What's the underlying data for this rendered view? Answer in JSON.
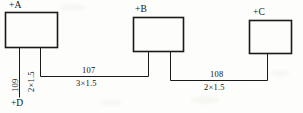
{
  "diagram": {
    "type": "electrical-wiring-diagram",
    "boxes": [
      {
        "id": "A",
        "label": "+A"
      },
      {
        "id": "B",
        "label": "+B"
      },
      {
        "id": "C",
        "label": "+C"
      }
    ],
    "terminals": [
      {
        "id": "D",
        "label": "+D"
      }
    ],
    "wires": [
      {
        "id": "109",
        "number": "109",
        "spec": "2×1.5",
        "orientation": "vertical",
        "from": "A",
        "to": "D"
      },
      {
        "id": "107",
        "number": "107",
        "spec": "3×1.5",
        "orientation": "horizontal",
        "from": "A",
        "to": "B"
      },
      {
        "id": "108",
        "number": "108",
        "spec": "2×1.5",
        "orientation": "horizontal",
        "from": "B",
        "to": "C"
      }
    ],
    "colors": {
      "line": "#1a1a1a",
      "background": "#fdfdfb",
      "text": "#131313"
    }
  }
}
